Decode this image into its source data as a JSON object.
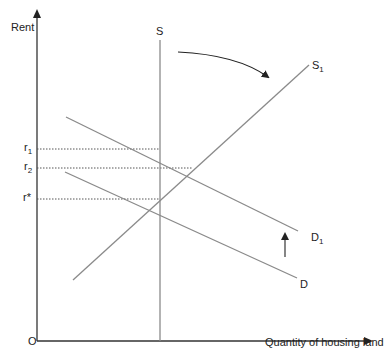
{
  "diagram": {
    "y_axis_label": "Rent",
    "x_axis_label": "Quantity of housing land",
    "origin_label": "O",
    "rent_levels": [
      {
        "main": "r",
        "sub": "1"
      },
      {
        "main": "r",
        "sub": "2"
      },
      {
        "main": "r*",
        "sub": ""
      }
    ],
    "curves": {
      "S": {
        "main": "S",
        "sub": ""
      },
      "S1": {
        "main": "S",
        "sub": "1"
      },
      "D1": {
        "main": "D",
        "sub": "1"
      },
      "D": {
        "main": "D",
        "sub": ""
      }
    },
    "colors": {
      "curve": "#8a8a8a",
      "axis": "#333333",
      "text": "#222222"
    }
  }
}
